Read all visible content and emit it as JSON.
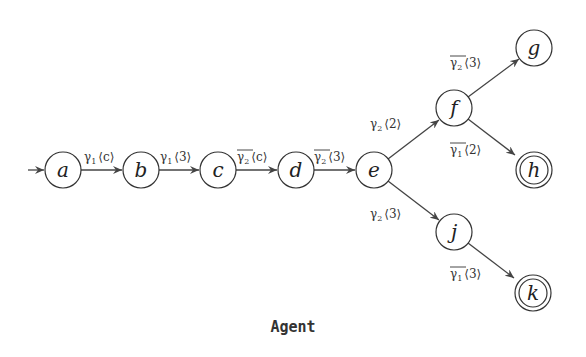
{
  "caption": "Agent",
  "nodes": [
    {
      "id": "a",
      "label": "a",
      "x": 63,
      "y": 170,
      "accepting": false,
      "initial": true
    },
    {
      "id": "b",
      "label": "b",
      "x": 141,
      "y": 170,
      "accepting": false
    },
    {
      "id": "c",
      "label": "c",
      "x": 218,
      "y": 170,
      "accepting": false
    },
    {
      "id": "d",
      "label": "d",
      "x": 296,
      "y": 170,
      "accepting": false
    },
    {
      "id": "e",
      "label": "e",
      "x": 374,
      "y": 170,
      "accepting": false
    },
    {
      "id": "f",
      "label": "f",
      "x": 454,
      "y": 108,
      "accepting": false
    },
    {
      "id": "g",
      "label": "g",
      "x": 534,
      "y": 48,
      "accepting": false
    },
    {
      "id": "h",
      "label": "h",
      "x": 534,
      "y": 170,
      "accepting": true
    },
    {
      "id": "j",
      "label": "j",
      "x": 454,
      "y": 232,
      "accepting": false
    },
    {
      "id": "k",
      "label": "k",
      "x": 533,
      "y": 293,
      "accepting": true
    }
  ],
  "edges": [
    {
      "from": "a",
      "to": "b",
      "symbol": "γ",
      "sub": "1",
      "bar": false,
      "arg": "⟨c⟩"
    },
    {
      "from": "b",
      "to": "c",
      "symbol": "γ",
      "sub": "1",
      "bar": false,
      "arg": "⟨3⟩"
    },
    {
      "from": "c",
      "to": "d",
      "symbol": "γ",
      "sub": "2",
      "bar": true,
      "arg": "⟨c⟩"
    },
    {
      "from": "d",
      "to": "e",
      "symbol": "γ",
      "sub": "2",
      "bar": true,
      "arg": "⟨3⟩"
    },
    {
      "from": "e",
      "to": "f",
      "symbol": "γ",
      "sub": "2",
      "bar": false,
      "arg": "⟨2⟩"
    },
    {
      "from": "f",
      "to": "g",
      "symbol": "γ",
      "sub": "2",
      "bar": true,
      "arg": "⟨3⟩"
    },
    {
      "from": "f",
      "to": "h",
      "symbol": "γ",
      "sub": "1",
      "bar": true,
      "arg": "⟨2⟩"
    },
    {
      "from": "e",
      "to": "j",
      "symbol": "γ",
      "sub": "2",
      "bar": false,
      "arg": "⟨3⟩"
    },
    {
      "from": "j",
      "to": "k",
      "symbol": "γ",
      "sub": "1",
      "bar": true,
      "arg": "⟨3⟩"
    }
  ],
  "labels": {
    "ab": {
      "sym": "γ",
      "sub": "1",
      "arg": "⟨c⟩"
    },
    "bc": {
      "sym": "γ",
      "sub": "1",
      "arg": "⟨3⟩"
    },
    "cd": {
      "sym": "γ",
      "sub": "2",
      "arg": "⟨c⟩"
    },
    "de": {
      "sym": "γ",
      "sub": "2",
      "arg": "⟨3⟩"
    },
    "ef": {
      "sym": "γ",
      "sub": "2",
      "arg": "⟨2⟩"
    },
    "fg": {
      "sym": "γ",
      "sub": "2",
      "arg": "⟨3⟩"
    },
    "fh": {
      "sym": "γ",
      "sub": "1",
      "arg": "⟨2⟩"
    },
    "ej": {
      "sym": "γ",
      "sub": "2",
      "arg": "⟨3⟩"
    },
    "jk": {
      "sym": "γ",
      "sub": "1",
      "arg": "⟨3⟩"
    }
  },
  "node_labels": {
    "a": "a",
    "b": "b",
    "c": "c",
    "d": "d",
    "e": "e",
    "f": "f",
    "g": "g",
    "h": "h",
    "j": "j",
    "k": "k"
  }
}
